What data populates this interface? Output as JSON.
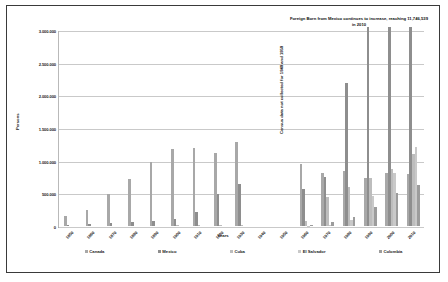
{
  "chart_data": {
    "type": "bar",
    "title": "",
    "xlabel": "Years",
    "ylabel": "Persons",
    "ylim": [
      0,
      3000000
    ],
    "ytick_labels": [
      "3.000.000",
      "2.500.000",
      "2.000.000",
      "1.500.000",
      "1.000.000",
      "500.000",
      "0"
    ],
    "ytick_values": [
      3000000,
      2500000,
      2000000,
      1500000,
      1000000,
      500000,
      0
    ],
    "grid": true,
    "legend_position": "bottom",
    "categories": [
      "1850",
      "1860",
      "1870",
      "1880",
      "1890",
      "1900",
      "1910",
      "1920",
      "1930",
      "1940",
      "1950",
      "1960",
      "1970",
      "1980",
      "1990",
      "2000",
      "2010"
    ],
    "series": [
      {
        "name": "Canada",
        "color": "#a8a8a8",
        "values": [
          147711,
          249970,
          493464,
          717157,
          980938,
          1179922,
          1204637,
          1124925,
          1286389,
          0,
          0,
          952500,
          812421,
          842859,
          744830,
          820771,
          798649
        ]
      },
      {
        "name": "Mexico",
        "color": "#8e8e8e",
        "values": [
          13317,
          27466,
          42435,
          68399,
          77853,
          103393,
          221915,
          486418,
          641462,
          0,
          0,
          575902,
          759711,
          2199221,
          4298014,
          9177487,
          11746539
        ]
      },
      {
        "name": "Cuba",
        "color": "#bdbdbd",
        "values": [
          0,
          0,
          0,
          0,
          0,
          11081,
          15133,
          14872,
          18493,
          0,
          0,
          79150,
          439048,
          607814,
          736971,
          872716,
          1104679
        ]
      },
      {
        "name": "El Salvador",
        "color": "#c9c9c9",
        "values": [
          0,
          0,
          0,
          0,
          0,
          0,
          0,
          0,
          0,
          0,
          0,
          6310,
          15717,
          94447,
          465433,
          817336,
          1214049
        ]
      },
      {
        "name": "Colombia",
        "color": "#9c9c9c",
        "values": [
          0,
          0,
          0,
          0,
          0,
          0,
          0,
          0,
          0,
          0,
          0,
          12582,
          63538,
          143508,
          286124,
          509872,
          636555
        ]
      }
    ],
    "annotations": [
      {
        "id": "mexico-note",
        "text": "Foreign Born from Mexico continues to increase, reaching  11,746,539 in 2010",
        "orientation": "horizontal"
      },
      {
        "id": "census-note",
        "text": "Census data not collected for 1940 and 1950",
        "orientation": "vertical"
      }
    ]
  }
}
